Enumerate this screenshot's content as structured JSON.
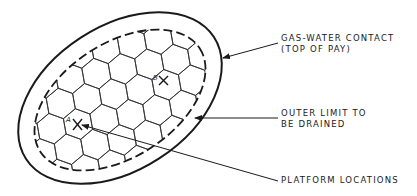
{
  "diagram": {
    "type": "reservoir-platform-layout",
    "labels": {
      "gas_water_contact": {
        "line1": "GAS-WATER CONTACT",
        "line2": "(TOP OF PAY)"
      },
      "outer_limit": {
        "line1": "OUTER LIMIT TO",
        "line2": "BE DRAINED"
      },
      "platform_locations": {
        "line1": "PLATFORM LOCATIONS"
      }
    },
    "points": [
      {
        "id": "A",
        "label": "A"
      },
      {
        "id": "B",
        "label": "B"
      }
    ],
    "colors": {
      "ink": "#1a1a1a",
      "background": "#ffffff"
    }
  }
}
